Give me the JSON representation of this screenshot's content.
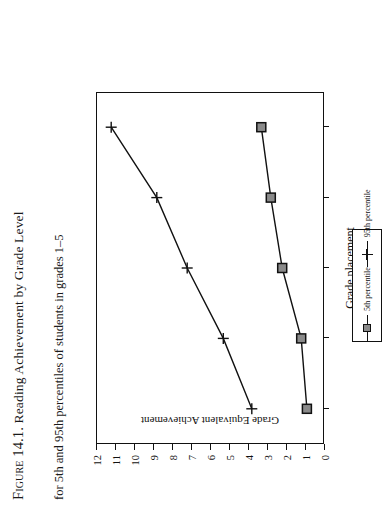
{
  "figure": {
    "label": "Figure 14.1.",
    "title": "Reading Achievement by Grade Level",
    "subtitle": "for 5th and 95th percentiles of students in grades 1–5"
  },
  "axes": {
    "xlabel": "Grade placement",
    "ylabel": "Grade Equivalent Achievement",
    "yticks": [
      "12",
      "11",
      "10",
      "9",
      "8",
      "7",
      "6",
      "5",
      "4",
      "3",
      "2",
      "1",
      "0"
    ],
    "xticks": [
      "1",
      "2",
      "3",
      "4",
      "5"
    ]
  },
  "legend": {
    "items": [
      {
        "label": "5th percentile",
        "marker": "square-marker",
        "color": "#8a8a8a"
      },
      {
        "label": "95th percentile",
        "marker": "cross-marker",
        "color": "#111111"
      }
    ]
  },
  "chart_data": {
    "type": "line",
    "title": "Reading Achievement by Grade Level",
    "subtitle": "for 5th and 95th percentiles of students in grades 1–5",
    "xlabel": "Grade placement",
    "ylabel": "Grade Equivalent Achievement",
    "x": [
      1,
      2,
      3,
      4,
      5
    ],
    "xlim": [
      0.5,
      5.5
    ],
    "ylim": [
      0,
      12
    ],
    "grid": false,
    "legend_position": "bottom-center",
    "series": [
      {
        "name": "5th percentile",
        "marker": "square",
        "color": "#8a8a8a",
        "values": [
          0.9,
          1.2,
          2.2,
          2.8,
          3.3
        ]
      },
      {
        "name": "95th percentile",
        "marker": "cross",
        "color": "#111111",
        "values": [
          3.8,
          5.3,
          7.2,
          8.8,
          11.2
        ]
      }
    ]
  }
}
